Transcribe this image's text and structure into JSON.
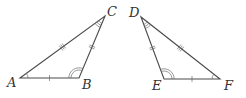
{
  "diagram": {
    "triangles": [
      {
        "name": "triangle-abc",
        "vertices": [
          "A",
          "B",
          "C"
        ],
        "side_ticks": {
          "AB": 1,
          "BC": 2,
          "AC": 3
        },
        "angle_arcs": {
          "A": 1,
          "B": 2,
          "C": 3
        }
      },
      {
        "name": "triangle-def",
        "vertices": [
          "D",
          "E",
          "F"
        ],
        "side_ticks": {
          "EF": 1,
          "DE": 2,
          "DF": 3
        },
        "angle_arcs": {
          "F": 1,
          "E": 2,
          "D": 3
        }
      }
    ],
    "labels": {
      "A": "A",
      "B": "B",
      "C": "C",
      "D": "D",
      "E": "E",
      "F": "F"
    }
  }
}
